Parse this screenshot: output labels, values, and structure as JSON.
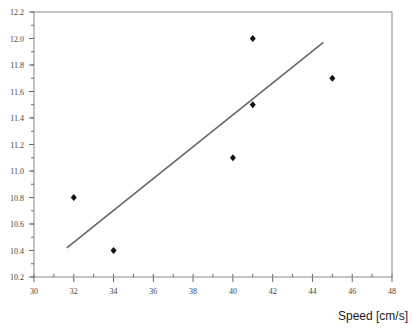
{
  "chart_data": {
    "type": "scatter",
    "title": "",
    "xlabel": "Speed [cm/s]",
    "ylabel": "",
    "xlim": [
      30,
      48
    ],
    "ylim": [
      10.2,
      12.2
    ],
    "x_ticks": [
      30,
      32,
      34,
      36,
      38,
      40,
      42,
      44,
      46,
      48
    ],
    "x_tick_labels": [
      "30",
      "32",
      "34",
      "36",
      "38",
      "40",
      "42",
      "44",
      "46",
      "48"
    ],
    "x_minor_step": 1,
    "y_ticks": [
      10.2,
      10.4,
      10.6,
      10.8,
      11.0,
      11.2,
      11.4,
      11.6,
      11.8,
      12.0,
      12.2
    ],
    "y_tick_labels": [
      "10.2",
      "10.4",
      "10.6",
      "10.8",
      "11.0",
      "11.2",
      "11.4",
      "11.6",
      "11.8",
      "12.0",
      "12.2"
    ],
    "y_minor_step": 0.1,
    "grid": false,
    "legend": null,
    "series": [
      {
        "name": "measurements",
        "type": "scatter",
        "marker": "diamond",
        "color": "#111111",
        "x": [
          32,
          34,
          40,
          41,
          41,
          45
        ],
        "y": [
          10.8,
          10.4,
          11.1,
          11.5,
          12.0,
          11.7
        ]
      },
      {
        "name": "linear fit",
        "type": "line",
        "color": "#666666",
        "x": [
          31.65,
          44.55
        ],
        "y": [
          10.42,
          11.97
        ]
      }
    ]
  },
  "layout": {
    "plot_left": 34,
    "plot_right": 392,
    "plot_top": 12,
    "plot_bottom": 277
  }
}
